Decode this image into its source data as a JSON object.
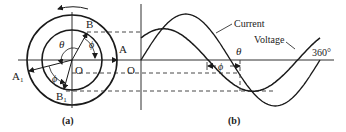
{
  "figure": {
    "panel_a": {
      "caption": "(a)",
      "labels": {
        "B": "B",
        "A": "A",
        "A1_main": "A",
        "A1_sub": "1",
        "B1_main": "B",
        "B1_sub": "1",
        "O": "O",
        "theta": "θ",
        "phi_top": "ϕ",
        "phi_bottom": "ϕ"
      },
      "rotation_direction": "counterclockwise"
    },
    "panel_b": {
      "caption": "(b)",
      "labels": {
        "O": "O",
        "theta": "θ",
        "phi": "ϕ",
        "end_angle": "360°",
        "current": "Current",
        "voltage": "Voltage"
      }
    }
  },
  "chart_data": {
    "type": "line",
    "title": "",
    "xlabel": "θ",
    "ylabel": "",
    "x_range_deg": [
      0,
      360
    ],
    "series": [
      {
        "name": "Current",
        "amplitude": 1.0,
        "phase_shift_deg": 0
      },
      {
        "name": "Voltage",
        "amplitude": 0.68,
        "phase_shift_deg": 45
      }
    ],
    "annotations": [
      "ϕ",
      "θ",
      "360°",
      "O"
    ]
  }
}
